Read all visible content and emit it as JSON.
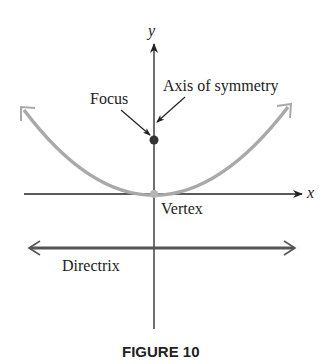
{
  "figure": {
    "caption": "FIGURE 10",
    "labels": {
      "y_axis": "y",
      "x_axis": "x",
      "focus": "Focus",
      "axis_of_symmetry": "Axis of symmetry",
      "vertex": "Vertex",
      "directrix": "Directrix"
    },
    "colors": {
      "parabola": "#a9a9a9",
      "axes": "#222222",
      "directrix": "#555555",
      "focus_point": "#333333"
    }
  }
}
